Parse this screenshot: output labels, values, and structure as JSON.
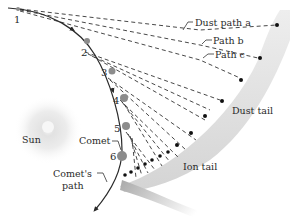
{
  "diagram": {
    "labels": {
      "sun": "Sun",
      "comet": "Comet",
      "comet_path_line1": "Comet's",
      "comet_path_line2": "path",
      "dust_path_a": "Dust path a",
      "path_b": "Path b",
      "path_c": "Path c",
      "dust_tail": "Dust tail",
      "ion_tail": "Ion tail"
    },
    "positions": [
      "1",
      "2",
      "3",
      "4",
      "5",
      "6"
    ],
    "colors": {
      "orbit": "#2a2a2a",
      "position_marker": "#8c8c8c",
      "dust_tail_band": "#d9d9d9",
      "ion_tail_band": "#bdbdbd",
      "sun_glow": "#e6e6e6",
      "dust_particle": "#111111"
    }
  }
}
